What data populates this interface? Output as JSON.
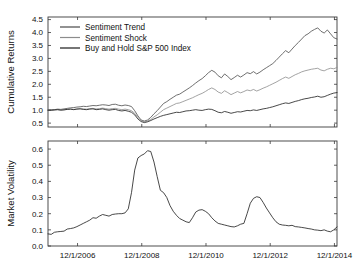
{
  "figure": {
    "background": "#ffffff",
    "width": 356,
    "height": 274
  },
  "chart_data": [
    {
      "type": "line",
      "panel": "top",
      "title": "",
      "xlabel": "",
      "ylabel": "Cumulative Returns",
      "xlim": [
        2006.0,
        2015.0
      ],
      "ylim": [
        0.35,
        4.6
      ],
      "yticks": [
        0.5,
        1.0,
        1.5,
        2.0,
        2.5,
        3.0,
        3.5,
        4.0,
        4.5
      ],
      "ytick_labels": [
        "0.5",
        "1.0",
        "1.5",
        "2.0",
        "2.5",
        "3.0",
        "3.5",
        "4.0",
        "4.5"
      ],
      "xticks": [
        2006.92,
        2008.92,
        2010.92,
        2012.92,
        2014.92
      ],
      "xtick_labels": [
        "",
        "",
        "",
        "",
        ""
      ],
      "grid": false,
      "legend_position": "upper-left",
      "series": [
        {
          "name": "Sentiment Trend",
          "color": "#4a4a4a",
          "x": [
            2006.0,
            2006.1,
            2006.2,
            2006.3,
            2006.4,
            2006.5,
            2006.6,
            2006.7,
            2006.8,
            2006.9,
            2007.0,
            2007.1,
            2007.2,
            2007.3,
            2007.4,
            2007.5,
            2007.6,
            2007.7,
            2007.8,
            2007.9,
            2008.0,
            2008.1,
            2008.2,
            2008.3,
            2008.4,
            2008.5,
            2008.6,
            2008.7,
            2008.8,
            2008.9,
            2009.0,
            2009.1,
            2009.2,
            2009.3,
            2009.4,
            2009.5,
            2009.6,
            2009.7,
            2009.8,
            2009.9,
            2010.0,
            2010.1,
            2010.2,
            2010.3,
            2010.4,
            2010.5,
            2010.6,
            2010.7,
            2010.8,
            2010.9,
            2011.0,
            2011.1,
            2011.2,
            2011.3,
            2011.4,
            2011.5,
            2011.6,
            2011.7,
            2011.8,
            2011.9,
            2012.0,
            2012.1,
            2012.2,
            2012.3,
            2012.4,
            2012.5,
            2012.6,
            2012.7,
            2012.8,
            2012.9,
            2013.0,
            2013.1,
            2013.2,
            2013.3,
            2013.4,
            2013.5,
            2013.6,
            2013.7,
            2013.8,
            2013.9,
            2014.0,
            2014.1,
            2014.2,
            2014.3,
            2014.4,
            2014.5,
            2014.6,
            2014.7,
            2014.8,
            2014.9,
            2015.0
          ],
          "values": [
            1.0,
            1.01,
            1.02,
            1.04,
            1.03,
            1.05,
            1.07,
            1.09,
            1.1,
            1.12,
            1.13,
            1.15,
            1.14,
            1.16,
            1.18,
            1.17,
            1.19,
            1.21,
            1.2,
            1.18,
            1.22,
            1.23,
            1.19,
            1.17,
            1.2,
            1.18,
            1.14,
            0.98,
            0.78,
            0.62,
            0.58,
            0.62,
            0.72,
            0.86,
            0.98,
            1.12,
            1.26,
            1.33,
            1.42,
            1.5,
            1.58,
            1.62,
            1.7,
            1.78,
            1.86,
            1.95,
            2.05,
            2.14,
            2.22,
            2.33,
            2.45,
            2.54,
            2.47,
            2.33,
            2.25,
            2.4,
            2.3,
            2.18,
            2.26,
            2.35,
            2.28,
            2.36,
            2.45,
            2.41,
            2.49,
            2.4,
            2.47,
            2.56,
            2.64,
            2.72,
            2.8,
            2.92,
            3.05,
            3.18,
            3.3,
            3.22,
            3.36,
            3.5,
            3.62,
            3.75,
            3.88,
            3.95,
            4.05,
            4.12,
            4.18,
            4.05,
            3.98,
            4.1,
            3.95,
            3.8,
            3.75
          ]
        },
        {
          "name": "Sentiment Shock",
          "color": "#8c8c8c",
          "x": [
            2006.0,
            2006.1,
            2006.2,
            2006.3,
            2006.4,
            2006.5,
            2006.6,
            2006.7,
            2006.8,
            2006.9,
            2007.0,
            2007.1,
            2007.2,
            2007.3,
            2007.4,
            2007.5,
            2007.6,
            2007.7,
            2007.8,
            2007.9,
            2008.0,
            2008.1,
            2008.2,
            2008.3,
            2008.4,
            2008.5,
            2008.6,
            2008.7,
            2008.8,
            2008.9,
            2009.0,
            2009.1,
            2009.2,
            2009.3,
            2009.4,
            2009.5,
            2009.6,
            2009.7,
            2009.8,
            2009.9,
            2010.0,
            2010.1,
            2010.2,
            2010.3,
            2010.4,
            2010.5,
            2010.6,
            2010.7,
            2010.8,
            2010.9,
            2011.0,
            2011.1,
            2011.2,
            2011.3,
            2011.4,
            2011.5,
            2011.6,
            2011.7,
            2011.8,
            2011.9,
            2012.0,
            2012.1,
            2012.2,
            2012.3,
            2012.4,
            2012.5,
            2012.6,
            2012.7,
            2012.8,
            2012.9,
            2013.0,
            2013.1,
            2013.2,
            2013.3,
            2013.4,
            2013.5,
            2013.6,
            2013.7,
            2013.8,
            2013.9,
            2014.0,
            2014.1,
            2014.2,
            2014.3,
            2014.4,
            2014.5,
            2014.6,
            2014.7,
            2014.8,
            2014.9,
            2015.0
          ],
          "values": [
            1.0,
            1.0,
            1.01,
            1.02,
            1.01,
            1.02,
            1.03,
            1.04,
            1.03,
            1.05,
            1.06,
            1.05,
            1.04,
            1.06,
            1.07,
            1.05,
            1.06,
            1.08,
            1.06,
            1.04,
            1.06,
            1.07,
            1.04,
            1.02,
            1.04,
            1.02,
            0.98,
            0.88,
            0.72,
            0.6,
            0.56,
            0.58,
            0.64,
            0.74,
            0.82,
            0.92,
            1.02,
            1.08,
            1.14,
            1.2,
            1.26,
            1.28,
            1.33,
            1.38,
            1.43,
            1.48,
            1.54,
            1.6,
            1.65,
            1.72,
            1.8,
            1.86,
            1.8,
            1.7,
            1.65,
            1.75,
            1.68,
            1.6,
            1.66,
            1.72,
            1.67,
            1.72,
            1.78,
            1.75,
            1.8,
            1.74,
            1.79,
            1.85,
            1.9,
            1.96,
            2.02,
            2.08,
            2.15,
            2.22,
            2.28,
            2.23,
            2.3,
            2.37,
            2.42,
            2.48,
            2.52,
            2.55,
            2.58,
            2.6,
            2.62,
            2.55,
            2.52,
            2.58,
            2.62,
            2.6,
            2.65
          ]
        },
        {
          "name": "Buy and Hold S&P 500 Index",
          "color": "#1a1a1a",
          "x": [
            2006.0,
            2006.1,
            2006.2,
            2006.3,
            2006.4,
            2006.5,
            2006.6,
            2006.7,
            2006.8,
            2006.9,
            2007.0,
            2007.1,
            2007.2,
            2007.3,
            2007.4,
            2007.5,
            2007.6,
            2007.7,
            2007.8,
            2007.9,
            2008.0,
            2008.1,
            2008.2,
            2008.3,
            2008.4,
            2008.5,
            2008.6,
            2008.7,
            2008.8,
            2008.9,
            2009.0,
            2009.1,
            2009.2,
            2009.3,
            2009.4,
            2009.5,
            2009.6,
            2009.7,
            2009.8,
            2009.9,
            2010.0,
            2010.1,
            2010.2,
            2010.3,
            2010.4,
            2010.5,
            2010.6,
            2010.7,
            2010.8,
            2010.9,
            2011.0,
            2011.1,
            2011.2,
            2011.3,
            2011.4,
            2011.5,
            2011.6,
            2011.7,
            2011.8,
            2011.9,
            2012.0,
            2012.1,
            2012.2,
            2012.3,
            2012.4,
            2012.5,
            2012.6,
            2012.7,
            2012.8,
            2012.9,
            2013.0,
            2013.1,
            2013.2,
            2013.3,
            2013.4,
            2013.5,
            2013.6,
            2013.7,
            2013.8,
            2013.9,
            2014.0,
            2014.1,
            2014.2,
            2014.3,
            2014.4,
            2014.5,
            2014.6,
            2014.7,
            2014.8,
            2014.9,
            2015.0
          ],
          "values": [
            1.0,
            1.0,
            1.01,
            1.02,
            1.0,
            1.01,
            1.03,
            1.04,
            1.02,
            1.04,
            1.05,
            1.03,
            1.02,
            1.04,
            1.05,
            1.02,
            1.03,
            1.05,
            1.02,
            1.0,
            1.02,
            1.03,
            0.99,
            0.97,
            0.99,
            0.96,
            0.92,
            0.82,
            0.66,
            0.56,
            0.52,
            0.55,
            0.6,
            0.66,
            0.71,
            0.76,
            0.8,
            0.83,
            0.86,
            0.89,
            0.92,
            0.91,
            0.94,
            0.97,
            0.98,
            1.0,
            1.02,
            1.0,
            0.99,
            1.02,
            1.04,
            1.03,
            0.98,
            0.92,
            0.9,
            0.95,
            0.92,
            0.88,
            0.91,
            0.94,
            0.93,
            0.96,
            0.99,
            0.98,
            1.01,
            0.99,
            1.02,
            1.05,
            1.07,
            1.1,
            1.13,
            1.17,
            1.21,
            1.25,
            1.28,
            1.26,
            1.3,
            1.34,
            1.37,
            1.41,
            1.44,
            1.46,
            1.49,
            1.51,
            1.54,
            1.5,
            1.52,
            1.57,
            1.62,
            1.66,
            1.68
          ]
        }
      ]
    },
    {
      "type": "line",
      "panel": "bottom",
      "title": "",
      "xlabel": "",
      "ylabel": "Market Volatility",
      "xlim": [
        2006.0,
        2015.0
      ],
      "ylim": [
        0.0,
        0.65
      ],
      "yticks": [
        0.0,
        0.1,
        0.2,
        0.3,
        0.4,
        0.5,
        0.6
      ],
      "ytick_labels": [
        "0.0",
        "0.1",
        "0.2",
        "0.3",
        "0.4",
        "0.5",
        "0.6"
      ],
      "xticks": [
        2006.92,
        2008.92,
        2010.92,
        2012.92,
        2014.92
      ],
      "xtick_labels": [
        "12/1/2006",
        "12/1/2008",
        "12/1/2010",
        "12/1/2012",
        "12/1/2014"
      ],
      "grid": false,
      "series": [
        {
          "name": "Market Volatility",
          "color": "#1a1a1a",
          "x": [
            2006.0,
            2006.1,
            2006.2,
            2006.3,
            2006.4,
            2006.5,
            2006.6,
            2006.7,
            2006.8,
            2006.9,
            2007.0,
            2007.1,
            2007.2,
            2007.3,
            2007.4,
            2007.5,
            2007.6,
            2007.7,
            2007.8,
            2007.9,
            2008.0,
            2008.1,
            2008.2,
            2008.3,
            2008.4,
            2008.5,
            2008.6,
            2008.7,
            2008.8,
            2008.9,
            2009.0,
            2009.1,
            2009.2,
            2009.3,
            2009.4,
            2009.5,
            2009.6,
            2009.7,
            2009.8,
            2009.9,
            2010.0,
            2010.1,
            2010.2,
            2010.3,
            2010.4,
            2010.5,
            2010.6,
            2010.7,
            2010.8,
            2010.9,
            2011.0,
            2011.1,
            2011.2,
            2011.3,
            2011.4,
            2011.5,
            2011.6,
            2011.7,
            2011.8,
            2011.9,
            2012.0,
            2012.1,
            2012.2,
            2012.3,
            2012.4,
            2012.5,
            2012.6,
            2012.7,
            2012.8,
            2012.9,
            2013.0,
            2013.1,
            2013.2,
            2013.3,
            2013.4,
            2013.5,
            2013.6,
            2013.7,
            2013.8,
            2013.9,
            2014.0,
            2014.1,
            2014.2,
            2014.3,
            2014.4,
            2014.5,
            2014.6,
            2014.7,
            2014.8,
            2014.9,
            2015.0
          ],
          "values": [
            0.075,
            0.072,
            0.085,
            0.088,
            0.09,
            0.092,
            0.105,
            0.108,
            0.112,
            0.12,
            0.13,
            0.14,
            0.15,
            0.16,
            0.175,
            0.172,
            0.185,
            0.195,
            0.19,
            0.185,
            0.195,
            0.198,
            0.2,
            0.2,
            0.205,
            0.23,
            0.33,
            0.47,
            0.545,
            0.56,
            0.57,
            0.59,
            0.585,
            0.52,
            0.43,
            0.345,
            0.33,
            0.3,
            0.25,
            0.215,
            0.19,
            0.17,
            0.16,
            0.15,
            0.145,
            0.175,
            0.21,
            0.222,
            0.225,
            0.215,
            0.2,
            0.175,
            0.155,
            0.14,
            0.135,
            0.13,
            0.125,
            0.12,
            0.118,
            0.125,
            0.135,
            0.14,
            0.2,
            0.265,
            0.295,
            0.305,
            0.3,
            0.27,
            0.235,
            0.205,
            0.175,
            0.15,
            0.135,
            0.13,
            0.128,
            0.125,
            0.128,
            0.12,
            0.118,
            0.115,
            0.112,
            0.108,
            0.105,
            0.1,
            0.098,
            0.095,
            0.1,
            0.092,
            0.088,
            0.1,
            0.118
          ]
        }
      ]
    }
  ]
}
